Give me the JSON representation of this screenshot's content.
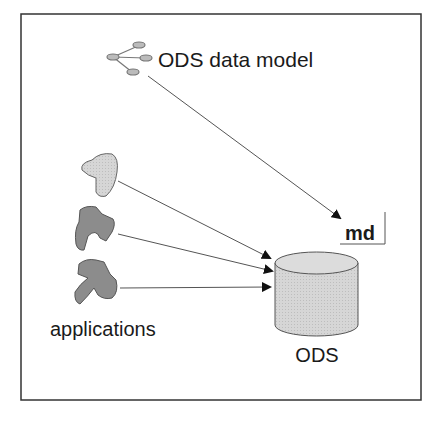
{
  "diagram": {
    "title_label": "ODS data model",
    "md_label": "md",
    "ods_label": "ODS",
    "applications_label": "applications",
    "icons": {
      "data_model": "tree-hierarchy-icon",
      "applications": [
        "application-blob-1",
        "application-blob-2",
        "application-blob-3"
      ],
      "store": "database-cylinder-icon"
    },
    "edges": [
      {
        "from": "ODS data model",
        "to": "md"
      },
      {
        "from": "application-blob-1",
        "to": "ODS"
      },
      {
        "from": "application-blob-2",
        "to": "ODS"
      },
      {
        "from": "application-blob-3",
        "to": "ODS"
      }
    ],
    "colors": {
      "frame": "#333333",
      "line": "#555555",
      "blob_light": "#c8c8c8",
      "blob_dark": "#8a8a8a",
      "cylinder": "#d4d4d4",
      "text": "#1a1a1a"
    }
  }
}
